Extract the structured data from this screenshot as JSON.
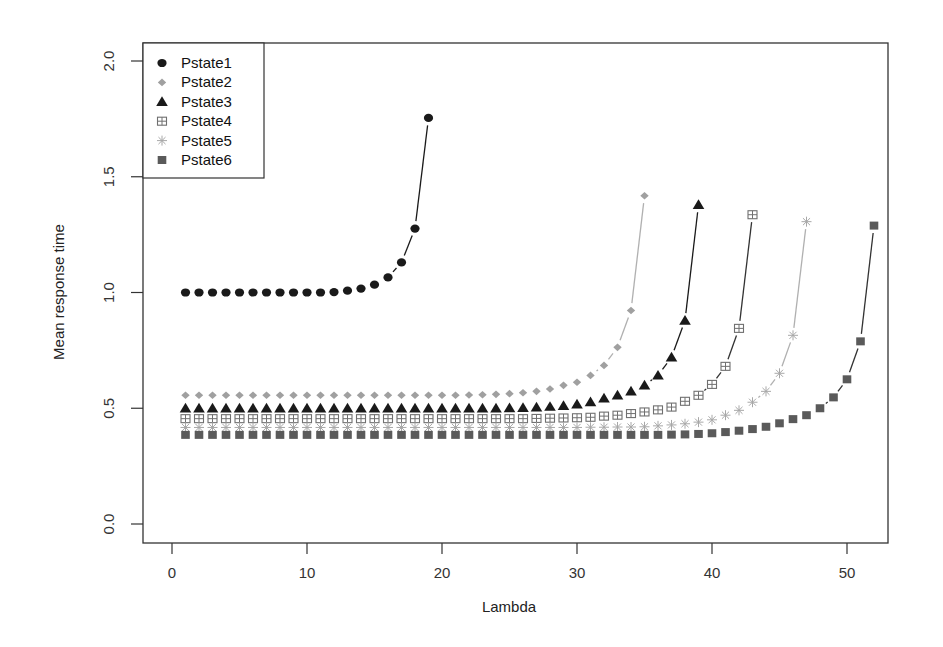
{
  "chart_data": {
    "type": "line",
    "title": "",
    "xlabel": "Lambda",
    "ylabel": "Mean response time",
    "xlim": [
      -1,
      54
    ],
    "ylim": [
      0,
      2.0
    ],
    "xticks": [
      0,
      10,
      20,
      30,
      40,
      50
    ],
    "xtick_labels": [
      "0",
      "10",
      "20",
      "30",
      "40",
      "50"
    ],
    "yticks": [
      0.0,
      0.5,
      1.0,
      1.5,
      2.0
    ],
    "ytick_labels": [
      "0.0",
      "0.5",
      "1.0",
      "1.5",
      "2.0"
    ],
    "grid": false,
    "legend_position": "top-left",
    "series": [
      {
        "name": "Pstate1",
        "marker": "circle",
        "color": "#1a1a1a",
        "line_color": "#1a1a1a",
        "x_start": 1,
        "values": [
          1.0,
          1.0,
          1.0,
          1.0,
          1.0,
          1.0,
          1.0,
          1.0,
          1.0,
          1.0,
          1.0,
          1.002,
          1.008,
          1.017,
          1.034,
          1.065,
          1.13,
          1.276,
          1.754
        ]
      },
      {
        "name": "Pstate2",
        "marker": "diamond",
        "color": "#a0a0a0",
        "line_color": "#b0b0b0",
        "x_start": 1,
        "values": [
          0.556,
          0.556,
          0.556,
          0.556,
          0.556,
          0.556,
          0.556,
          0.556,
          0.556,
          0.556,
          0.556,
          0.556,
          0.556,
          0.556,
          0.556,
          0.556,
          0.556,
          0.556,
          0.556,
          0.556,
          0.556,
          0.557,
          0.558,
          0.56,
          0.563,
          0.567,
          0.573,
          0.583,
          0.599,
          0.612,
          0.642,
          0.685,
          0.763,
          0.922,
          1.418
        ]
      },
      {
        "name": "Pstate3",
        "marker": "triangle",
        "color": "#1a1a1a",
        "line_color": "#1a1a1a",
        "x_start": 1,
        "values": [
          0.5,
          0.5,
          0.5,
          0.5,
          0.5,
          0.5,
          0.5,
          0.5,
          0.5,
          0.5,
          0.5,
          0.5,
          0.5,
          0.5,
          0.5,
          0.5,
          0.5,
          0.5,
          0.5,
          0.5,
          0.5,
          0.5,
          0.5,
          0.5,
          0.501,
          0.502,
          0.504,
          0.507,
          0.511,
          0.517,
          0.527,
          0.543,
          0.556,
          0.573,
          0.599,
          0.642,
          0.72,
          0.879,
          1.379
        ]
      },
      {
        "name": "Pstate4",
        "marker": "square-plus",
        "color": "#707070",
        "line_color": "#333333",
        "x_start": 1,
        "values": [
          0.455,
          0.455,
          0.455,
          0.455,
          0.455,
          0.455,
          0.455,
          0.455,
          0.455,
          0.455,
          0.455,
          0.455,
          0.455,
          0.455,
          0.455,
          0.455,
          0.455,
          0.455,
          0.455,
          0.455,
          0.455,
          0.455,
          0.455,
          0.455,
          0.455,
          0.455,
          0.456,
          0.457,
          0.458,
          0.459,
          0.461,
          0.466,
          0.47,
          0.477,
          0.484,
          0.493,
          0.505,
          0.53,
          0.556,
          0.603,
          0.681,
          0.845,
          1.336
        ]
      },
      {
        "name": "Pstate5",
        "marker": "asterisk",
        "color": "#a8a8a8",
        "line_color": "#b0b0b0",
        "x_start": 1,
        "values": [
          0.417,
          0.417,
          0.417,
          0.417,
          0.417,
          0.417,
          0.417,
          0.417,
          0.417,
          0.417,
          0.417,
          0.417,
          0.417,
          0.417,
          0.417,
          0.417,
          0.417,
          0.417,
          0.417,
          0.417,
          0.417,
          0.417,
          0.417,
          0.417,
          0.417,
          0.417,
          0.417,
          0.417,
          0.417,
          0.417,
          0.418,
          0.418,
          0.419,
          0.419,
          0.42,
          0.424,
          0.428,
          0.433,
          0.44,
          0.45,
          0.47,
          0.491,
          0.526,
          0.573,
          0.651,
          0.815,
          1.306
        ]
      },
      {
        "name": "Pstate6",
        "marker": "square",
        "color": "#5a5a5a",
        "line_color": "#333333",
        "x_start": 1,
        "values": [
          0.385,
          0.385,
          0.385,
          0.385,
          0.385,
          0.385,
          0.385,
          0.385,
          0.385,
          0.385,
          0.385,
          0.385,
          0.385,
          0.385,
          0.385,
          0.385,
          0.385,
          0.385,
          0.385,
          0.385,
          0.385,
          0.385,
          0.385,
          0.385,
          0.385,
          0.385,
          0.385,
          0.385,
          0.385,
          0.385,
          0.385,
          0.385,
          0.385,
          0.385,
          0.385,
          0.385,
          0.386,
          0.387,
          0.389,
          0.392,
          0.397,
          0.403,
          0.41,
          0.42,
          0.435,
          0.453,
          0.47,
          0.5,
          0.547,
          0.625,
          0.789,
          1.289
        ]
      }
    ]
  }
}
